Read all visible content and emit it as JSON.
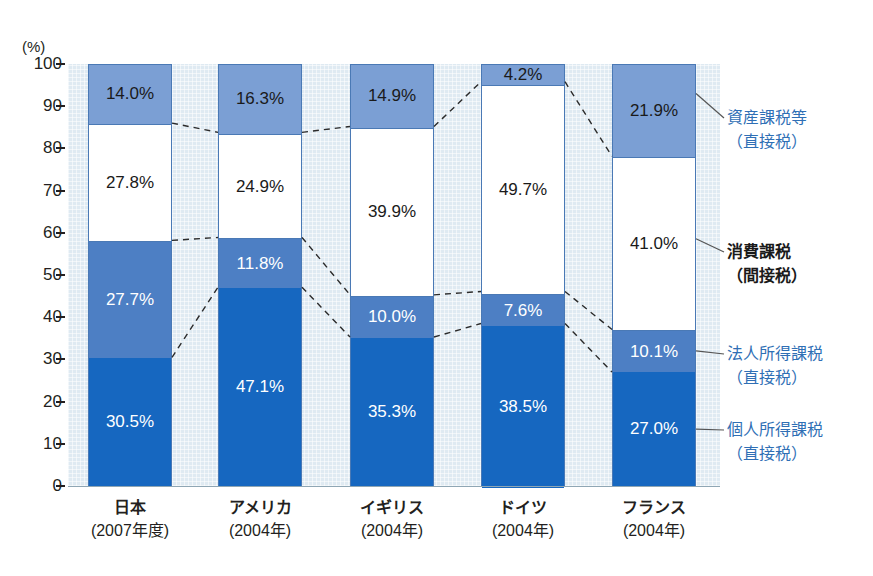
{
  "chart_data": {
    "type": "bar",
    "title": "",
    "subtitle": "",
    "xlabel": "",
    "ylabel": "(%)",
    "ylim": [
      0,
      100
    ],
    "grid": false,
    "stacked": true,
    "stack_total": 100,
    "legend_position": "right",
    "unit_label": "(%)",
    "y_ticks": [
      "100",
      "90",
      "80",
      "70",
      "60",
      "50",
      "40",
      "30",
      "20",
      "10",
      "0"
    ],
    "y_tick_values": [
      100,
      90,
      80,
      70,
      60,
      50,
      40,
      30,
      20,
      10,
      0
    ],
    "categories": [
      "日本",
      "アメリカ",
      "イギリス",
      "ドイツ",
      "フランス"
    ],
    "category_years": [
      "(2007年度)",
      "(2004年)",
      "(2004年)",
      "(2004年)",
      "(2004年)"
    ],
    "series": [
      {
        "name": "個人所得課税（直接税）",
        "color": "#1667c0",
        "values": [
          30.5,
          47.1,
          35.3,
          38.5,
          27.0
        ],
        "labels": [
          "30.5%",
          "47.1%",
          "35.3%",
          "38.5%",
          "27.0%"
        ]
      },
      {
        "name": "法人所得課税（直接税）",
        "color": "#4d7fc4",
        "values": [
          27.7,
          11.8,
          10.0,
          7.6,
          10.1
        ],
        "labels": [
          "27.7%",
          "11.8%",
          "10.0%",
          "7.6%",
          "10.1%"
        ]
      },
      {
        "name": "消費課税（間接税）",
        "color": "#ffffff",
        "values": [
          27.8,
          24.9,
          39.9,
          49.7,
          41.0
        ],
        "labels": [
          "27.8%",
          "24.9%",
          "39.9%",
          "49.7%",
          "41.0%"
        ]
      },
      {
        "name": "資産課税等（直接税）",
        "color": "#7b9fd4",
        "values": [
          14.0,
          16.3,
          14.9,
          4.2,
          21.9
        ],
        "labels": [
          "14.0%",
          "16.3%",
          "14.9%",
          "4.2%",
          "21.9%"
        ]
      }
    ],
    "legend": [
      {
        "line1": "資産課税等",
        "line2": "（直接税）",
        "color": "#2f6fb5",
        "style": "blue"
      },
      {
        "line1": "消費課税",
        "line2": "（間接税）",
        "color": "#1a1a1a",
        "style": "dark"
      },
      {
        "line1": "法人所得課税",
        "line2": "（直接税）",
        "color": "#2f6fb5",
        "style": "blue"
      },
      {
        "line1": "個人所得課税",
        "line2": "（直接税）",
        "color": "#2f6fb5",
        "style": "blue"
      }
    ],
    "annotations": "Dashed leader lines connect matching stack boundaries between adjacent country bars.",
    "colors": {
      "plot_background": "#dfeaf2",
      "asset_tax": "#7b9fd4",
      "consumption_tax": "#ffffff",
      "corporate_tax": "#4d7fc4",
      "individual_tax": "#1667c0",
      "bar_border": "#4a79b5",
      "text": "#231f20",
      "legend_blue": "#2f6fb5"
    }
  }
}
